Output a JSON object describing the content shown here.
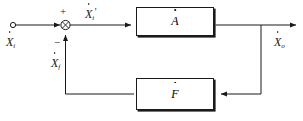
{
  "diagram": {
    "stroke_color": "#1a1a1a",
    "background_color": "#ffffff",
    "labels": {
      "input": {
        "symbol": "X",
        "subscript": "i",
        "prime": "",
        "dot": true,
        "text": "Ẋi"
      },
      "error": {
        "symbol": "X",
        "subscript": "i",
        "prime": "'",
        "dot": true,
        "text": "Ẋi'"
      },
      "feedback": {
        "symbol": "X",
        "subscript": "f",
        "prime": "",
        "dot": true,
        "text": "Ẋf"
      },
      "output": {
        "symbol": "X",
        "subscript": "o",
        "prime": "",
        "dot": true,
        "text": "Ẋo"
      }
    },
    "summing_junction": {
      "name": "summing-junction",
      "plus_sign": "+",
      "minus_sign": "−",
      "shape": "circle-with-cross"
    },
    "blocks": [
      {
        "id": "forward",
        "symbol": "A",
        "dot": true,
        "text": "Ȧ"
      },
      {
        "id": "feedback",
        "symbol": "F",
        "dot": true,
        "text": "Ḟ"
      }
    ]
  }
}
